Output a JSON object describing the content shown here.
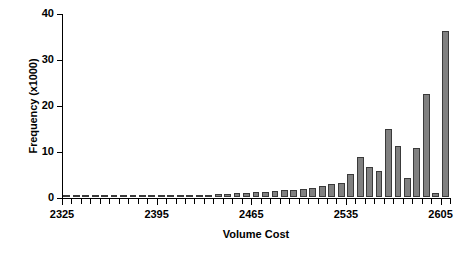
{
  "chart_data": {
    "type": "bar",
    "title": "",
    "xlabel": "Volume Cost",
    "ylabel": "Frequency (x1000)",
    "xlim": [
      2325,
      2612
    ],
    "ylim": [
      0,
      40
    ],
    "grid": false,
    "legend": "none",
    "bar_color": "#808080",
    "bar_edge_color": "#3a3a3a",
    "axis_color": "#000000",
    "background": "#ffffff",
    "bin_width": 7,
    "x_tick_labels": [
      "2325",
      "2395",
      "2465",
      "2535",
      "2605"
    ],
    "x_tick_values": [
      2325,
      2395,
      2465,
      2535,
      2605
    ],
    "y_tick_labels": [
      "0",
      "10",
      "20",
      "30",
      "40"
    ],
    "y_tick_values": [
      0,
      10,
      20,
      30,
      40
    ],
    "categories": [
      "2325",
      "2332",
      "2339",
      "2346",
      "2353",
      "2360",
      "2367",
      "2374",
      "2381",
      "2388",
      "2395",
      "2402",
      "2409",
      "2416",
      "2423",
      "2430",
      "2437",
      "2444",
      "2451",
      "2458",
      "2465",
      "2472",
      "2479",
      "2486",
      "2493",
      "2500",
      "2507",
      "2514",
      "2521",
      "2528",
      "2535",
      "2542",
      "2549",
      "2556",
      "2563",
      "2570",
      "2577",
      "2584",
      "2591",
      "2598",
      "2605"
    ],
    "values": [
      0.1,
      0.15,
      0.15,
      0.2,
      0.2,
      0.2,
      0.25,
      0.25,
      0.3,
      0.3,
      0.35,
      0.35,
      0.4,
      0.4,
      0.5,
      0.5,
      0.6,
      0.7,
      0.8,
      0.9,
      1.0,
      1.1,
      1.2,
      1.5,
      1.6,
      1.7,
      2.0,
      2.3,
      2.8,
      3.0,
      5.0,
      8.8,
      6.6,
      5.6,
      14.7,
      11.0,
      4.2,
      10.6,
      22.4,
      0.9,
      36.0
    ]
  }
}
